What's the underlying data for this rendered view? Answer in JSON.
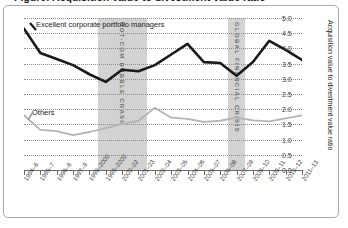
{
  "figure": {
    "title": "Figure: Acquisition value to divestment value ratio"
  },
  "chart_data": {
    "type": "line",
    "title": "Figure: Acquisition value to divestment value ratio",
    "xlabel": "",
    "ylabel": "Acquisition value to divestment value ratio",
    "ylim": [
      0.0,
      5.0
    ],
    "ytick_step": 0.5,
    "grid": true,
    "axis_side": "right",
    "legend_position": "inline-annotation",
    "categories": [
      "1994–6",
      "1995–7",
      "1996–8",
      "1997–9",
      "1998–2000",
      "1999–2000",
      "2000–02",
      "2001–03",
      "2002–04",
      "2003–05",
      "2004–06",
      "2005–07",
      "2006–08",
      "2007–09",
      "2008–10",
      "2009–11",
      "2010–12",
      "2011–13"
    ],
    "ytick_labels": [
      "0.0",
      "0.5",
      "1.0",
      "1.5",
      "2.0",
      "2.5",
      "3.0",
      "3.5",
      "4.0",
      "4.5",
      "5.0"
    ],
    "series": [
      {
        "name": "Excellent corporate portfolio managers",
        "color": "#1a1a1a",
        "values": [
          4.65,
          3.85,
          3.65,
          3.45,
          3.15,
          2.9,
          3.3,
          3.25,
          3.45,
          3.8,
          4.15,
          3.55,
          3.52,
          3.1,
          3.55,
          4.25,
          3.95,
          3.62
        ]
      },
      {
        "name": "Others",
        "color": "#b4b4b4",
        "values": [
          1.8,
          1.32,
          1.28,
          1.15,
          1.25,
          1.38,
          1.52,
          1.62,
          2.05,
          1.72,
          1.68,
          1.58,
          1.62,
          1.72,
          1.63,
          1.6,
          1.7,
          1.8
        ]
      }
    ],
    "annotations": [
      {
        "text": "Excellent corporate portfolio managers",
        "series": "Excellent corporate portfolio managers"
      },
      {
        "text": "Others",
        "series": "Others"
      }
    ],
    "shaded_bands": [
      {
        "label": "DOT-COM BUBBLE CRASH",
        "start": "1999–2000",
        "end": "2002–04",
        "color": "#d2d2d2"
      },
      {
        "label": "GLOBAL FINANCIAL CRISIS",
        "start": "2007–09",
        "end": "2008–10",
        "color": "#d2d2d2"
      }
    ]
  }
}
